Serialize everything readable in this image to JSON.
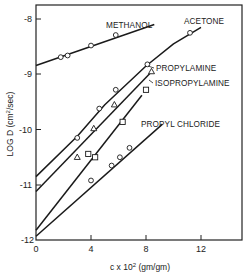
{
  "chart_data": {
    "type": "line",
    "title": "",
    "xlabel": "c x 10^2 (gm/gm)",
    "ylabel": "LOG D (cm^2/sec)",
    "xlim": [
      0,
      15
    ],
    "ylim": [
      -12,
      -7.75
    ],
    "x_ticks": [
      0,
      4,
      8,
      12
    ],
    "y_ticks": [
      -8,
      -9,
      -10,
      -11,
      -12
    ],
    "grid": false,
    "legend": "inline labels",
    "series": [
      {
        "name": "METHANOL",
        "marker": "circle",
        "points": [
          [
            1.8,
            -8.69
          ],
          [
            2.3,
            -8.66
          ],
          [
            4.0,
            -8.48
          ],
          [
            5.8,
            -8.29
          ]
        ],
        "fit_line": [
          [
            0,
            -8.84
          ],
          [
            8.6,
            -8.1
          ]
        ]
      },
      {
        "name": "ACETONE",
        "marker": "circle",
        "points": [
          [
            3.0,
            -10.15
          ],
          [
            4.6,
            -9.62
          ],
          [
            5.8,
            -9.28
          ],
          [
            8.1,
            -8.82
          ],
          [
            11.2,
            -8.25
          ]
        ],
        "fit_line": [
          [
            0,
            -10.85
          ],
          [
            3.0,
            -10.12
          ],
          [
            5.0,
            -9.55
          ],
          [
            8.0,
            -8.85
          ],
          [
            10.0,
            -8.45
          ],
          [
            12.0,
            -8.15
          ]
        ]
      },
      {
        "name": "PROPYLAMINE",
        "marker": "triangle",
        "points": [
          [
            3.0,
            -10.5
          ],
          [
            4.2,
            -9.98
          ],
          [
            5.7,
            -9.55
          ],
          [
            8.4,
            -8.95
          ]
        ],
        "fit_line": [
          [
            0,
            -11.12
          ],
          [
            8.3,
            -8.98
          ]
        ]
      },
      {
        "name": "ISOPROPYLAMINE",
        "marker": "square",
        "points": [
          [
            3.8,
            -10.44
          ],
          [
            4.3,
            -10.5
          ],
          [
            6.3,
            -9.86
          ],
          [
            8.0,
            -9.28
          ]
        ],
        "fit_line": [
          [
            0,
            -11.82
          ],
          [
            7.7,
            -9.38
          ]
        ]
      },
      {
        "name": "PROPYL CHLORIDE",
        "marker": "circle",
        "points": [
          [
            4.0,
            -10.92
          ],
          [
            5.5,
            -10.65
          ],
          [
            6.1,
            -10.5
          ],
          [
            6.8,
            -10.33
          ]
        ],
        "fit_line": [
          [
            0,
            -11.93
          ],
          [
            9.2,
            -9.9
          ]
        ]
      }
    ]
  },
  "labels": {
    "y_axis_title": "LOG D (cm",
    "y_axis_sup": "2",
    "y_axis_tail": "/sec)",
    "x_axis_title": "c x 10",
    "x_axis_sup": "2",
    "x_axis_tail": " (gm/gm)",
    "methanol": "METHANOL",
    "acetone": "ACETONE",
    "propylamine": "PROPYLAMINE",
    "isopropylamine": "ISOPROPYLAMINE",
    "propyl_chloride": "PROPYL CHLORIDE",
    "y_tick_labels": [
      "-8",
      "-9",
      "-10",
      "-11",
      "-12"
    ],
    "x_tick_labels": [
      "0",
      "4",
      "8",
      "12"
    ]
  }
}
